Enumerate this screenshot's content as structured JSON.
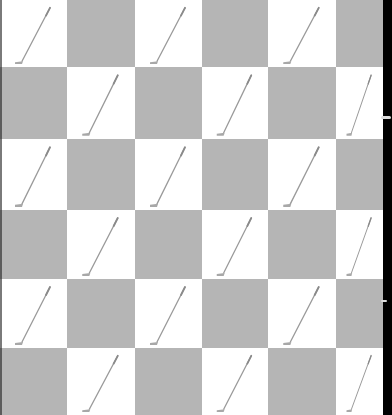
{
  "image": {
    "description": "Checkerboard pattern of grey and white squares with a thin golf club (putter) drawn diagonally in each white square",
    "grid": {
      "columns": 6,
      "rows": 6
    },
    "colors": {
      "dark_square": "#b5b5b5",
      "light_square": "#ffffff",
      "club": "#9a9a9a",
      "right_border": "#000000"
    },
    "motif_icon": "golf-club-icon",
    "col_edges": [
      0,
      67,
      135,
      202,
      268,
      336,
      383
    ],
    "row_edges": [
      0,
      67,
      139,
      210,
      279,
      348,
      415
    ]
  }
}
